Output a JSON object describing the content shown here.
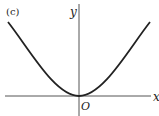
{
  "figure": {
    "panel_label": "(c)",
    "x_axis_label": "x",
    "y_axis_label": "y",
    "origin_label": "O",
    "curve_description": "even function flat at origin, like y = x^4",
    "colors": {
      "curve": "#222222",
      "axes": "#555555",
      "background": "#ffffff"
    }
  }
}
